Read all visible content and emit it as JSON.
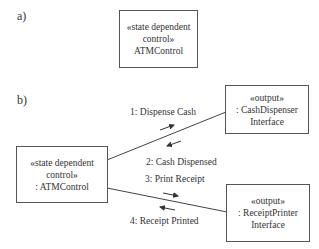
{
  "panel_a": {
    "label": "a)",
    "object": {
      "stereotype_line1": "«state dependent",
      "stereotype_line2": "control»",
      "name": "ATMControl"
    }
  },
  "panel_b": {
    "label": "b)",
    "atm_control": {
      "stereotype_line1": "«state dependent",
      "stereotype_line2": "control»",
      "name": ": ATMControl"
    },
    "cash_dispenser": {
      "stereotype": "«output»",
      "name_line1": ": CashDispenser",
      "name_line2": "Interface"
    },
    "receipt_printer": {
      "stereotype": "«output»",
      "name_line1": ": ReceiptPrinter",
      "name_line2": "Interface"
    },
    "messages": [
      {
        "text": "1: Dispense Cash",
        "direction": "to-cash-dispenser"
      },
      {
        "text": "2: Cash Dispensed",
        "direction": "to-atm-control"
      },
      {
        "text": "3: Print Receipt",
        "direction": "to-receipt-printer"
      },
      {
        "text": "4: Receipt Printed",
        "direction": "to-atm-control"
      }
    ]
  }
}
